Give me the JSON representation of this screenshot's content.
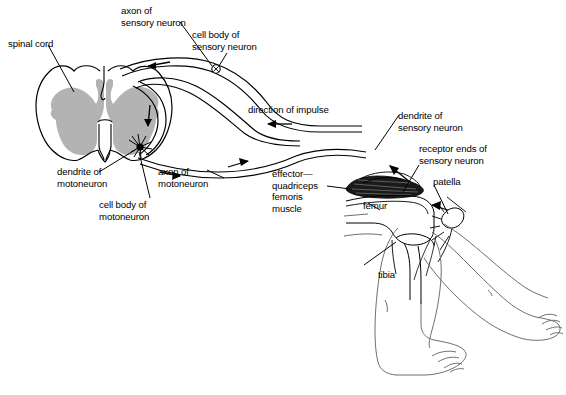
{
  "figure": {
    "background_color": "#ffffff",
    "line_color": "#000000",
    "gray_matter_color": "#b3b3b3",
    "skin_line_color": "#6e6e6e",
    "labels": {
      "spinal_cord": "spinal cord",
      "axon_of_sensory_neuron": "axon of\nsensory neuron",
      "cell_body_of_sensory_neuron": "cell body of\nsensory neuron",
      "direction_of_impulse": "direction of impulse",
      "dendrite_of_sensory_neuron": "dendrite of\nsensory neuron",
      "receptor_ends_of_sensory_neuron": "receptor ends of\nsensory neuron",
      "patella": "patella",
      "femur": "femur",
      "tibia": "tibia",
      "effector_quadriceps": "effector—\nquadriceps\nfemoris\nmuscle",
      "dendrite_of_motoneuron": "dendrite of\nmotoneuron",
      "axon_of_motoneuron": "axon of\nmotoneuron",
      "cell_body_of_motoneuron": "cell body of\nmotoneuron"
    }
  }
}
